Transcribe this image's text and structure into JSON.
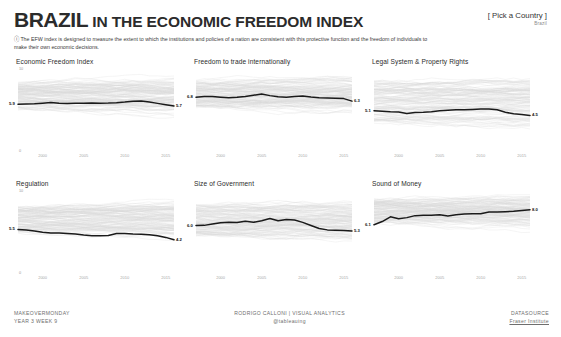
{
  "header": {
    "title_strong": "BRAZIL",
    "title_rest": " IN THE ECONOMIC FREEDOM INDEX",
    "description": "ⓘ The EFW index is designed to measure the extent to which the institutions and policies of a nation are consistent with this protective function and the freedom of individuals to make their own economic decisions.",
    "picker_label": "[ Pick a Country ]",
    "picker_value": "Brazil"
  },
  "axis": {
    "y_top": "10",
    "y_bottom": "0",
    "x_ticks": [
      "2000",
      "2005",
      "2010",
      "2015"
    ]
  },
  "footer": {
    "left_line1": "MAKEOVERMONDAY",
    "left_line2": "YEAR 3 WEEK 9",
    "center_line1": "RODRIGO CALLONI | VISUAL ANALYTICS",
    "center_line2": "@tableauing",
    "right_line1": "DATASOURCE",
    "right_line2": "Fraser Institute"
  },
  "chart_data": [
    {
      "type": "line",
      "title": "Economic Freedom Index",
      "xlabel": "",
      "ylabel": "",
      "ylim": [
        0,
        10
      ],
      "xlim": [
        1997,
        2016
      ],
      "grid": false,
      "legend": "none",
      "start_label": "5.9",
      "end_label": "5.7",
      "x": [
        1997,
        1998,
        1999,
        2000,
        2001,
        2002,
        2003,
        2004,
        2005,
        2006,
        2007,
        2008,
        2009,
        2010,
        2011,
        2012,
        2013,
        2014,
        2015,
        2016
      ],
      "values": [
        5.9,
        5.93,
        5.97,
        6.05,
        6.12,
        6.02,
        6.0,
        6.03,
        6.05,
        6.07,
        6.05,
        6.06,
        6.1,
        6.18,
        6.3,
        6.33,
        6.2,
        6.02,
        5.85,
        5.7
      ],
      "band": {
        "description": "light grey background lines of all other countries",
        "top": 8.6,
        "bottom": 5.3
      }
    },
    {
      "type": "line",
      "title": "Freedom to trade internationally",
      "xlabel": "",
      "ylabel": "",
      "ylim": [
        0,
        10
      ],
      "xlim": [
        1997,
        2016
      ],
      "grid": false,
      "legend": "none",
      "start_label": "6.8",
      "end_label": "6.3",
      "x": [
        1997,
        1998,
        1999,
        2000,
        2001,
        2002,
        2003,
        2004,
        2005,
        2006,
        2007,
        2008,
        2009,
        2010,
        2011,
        2012,
        2013,
        2014,
        2015,
        2016
      ],
      "values": [
        6.8,
        6.88,
        6.9,
        6.8,
        6.72,
        6.78,
        6.9,
        7.05,
        7.2,
        7.0,
        6.85,
        6.78,
        6.88,
        6.95,
        6.82,
        6.72,
        6.7,
        6.68,
        6.62,
        6.3
      ],
      "band": {
        "description": "light grey background lines of all other countries",
        "top": 8.8,
        "bottom": 5.6
      }
    },
    {
      "type": "line",
      "title": "Legal System & Property Rights",
      "xlabel": "",
      "ylabel": "",
      "ylim": [
        0,
        10
      ],
      "xlim": [
        1997,
        2016
      ],
      "grid": false,
      "legend": "none",
      "start_label": "5.1",
      "end_label": "4.5",
      "x": [
        1997,
        1998,
        1999,
        2000,
        2001,
        2002,
        2003,
        2004,
        2005,
        2006,
        2007,
        2008,
        2009,
        2010,
        2011,
        2012,
        2013,
        2014,
        2015,
        2016
      ],
      "values": [
        5.1,
        5.02,
        4.95,
        4.92,
        4.75,
        4.88,
        4.9,
        4.95,
        5.08,
        5.15,
        5.2,
        5.22,
        5.25,
        5.3,
        5.32,
        5.22,
        4.9,
        4.7,
        4.6,
        4.5
      ],
      "band": {
        "description": "light grey background lines of all other countries",
        "top": 8.9,
        "bottom": 3.6
      }
    },
    {
      "type": "line",
      "title": "Regulation",
      "xlabel": "",
      "ylabel": "",
      "ylim": [
        0,
        10
      ],
      "xlim": [
        1997,
        2016
      ],
      "grid": false,
      "legend": "none",
      "start_label": "5.5",
      "end_label": "4.2",
      "x": [
        1997,
        1998,
        1999,
        2000,
        2001,
        2002,
        2003,
        2004,
        2005,
        2006,
        2007,
        2008,
        2009,
        2010,
        2011,
        2012,
        2013,
        2014,
        2015,
        2016
      ],
      "values": [
        5.5,
        5.42,
        5.3,
        5.15,
        5.05,
        5.06,
        5.0,
        4.92,
        4.8,
        4.72,
        4.7,
        4.75,
        5.0,
        4.98,
        4.92,
        4.9,
        4.82,
        4.7,
        4.5,
        4.2
      ],
      "band": {
        "description": "light grey background lines of all other countries",
        "top": 8.3,
        "bottom": 5.2
      }
    },
    {
      "type": "line",
      "title": "Size of Government",
      "xlabel": "",
      "ylabel": "",
      "ylim": [
        0,
        10
      ],
      "xlim": [
        1997,
        2016
      ],
      "grid": false,
      "legend": "none",
      "start_label": "6.0",
      "end_label": "5.3",
      "x": [
        1997,
        1998,
        1999,
        2000,
        2001,
        2002,
        2003,
        2004,
        2005,
        2006,
        2007,
        2008,
        2009,
        2010,
        2011,
        2012,
        2013,
        2014,
        2015,
        2016
      ],
      "values": [
        6.0,
        6.02,
        6.2,
        6.35,
        6.4,
        6.38,
        6.55,
        6.4,
        6.6,
        6.9,
        6.6,
        6.75,
        6.7,
        6.4,
        6.0,
        5.62,
        5.45,
        5.4,
        5.36,
        5.3
      ],
      "band": {
        "description": "light grey background lines of all other countries",
        "top": 8.6,
        "bottom": 4.8
      }
    },
    {
      "type": "line",
      "title": "Sound of Money",
      "xlabel": "",
      "ylabel": "",
      "ylim": [
        0,
        10
      ],
      "xlim": [
        1997,
        2016
      ],
      "grid": false,
      "legend": "none",
      "start_label": "6.1",
      "end_label": "8.0",
      "x": [
        1997,
        1998,
        1999,
        2000,
        2001,
        2002,
        2003,
        2004,
        2005,
        2006,
        2007,
        2008,
        2009,
        2010,
        2011,
        2012,
        2013,
        2014,
        2015,
        2016
      ],
      "values": [
        6.1,
        6.5,
        7.1,
        6.85,
        7.0,
        7.25,
        7.3,
        7.3,
        7.35,
        7.2,
        7.35,
        7.45,
        7.5,
        7.5,
        7.7,
        7.72,
        7.75,
        7.8,
        7.9,
        8.0
      ],
      "band": {
        "description": "light grey background lines of all other countries",
        "top": 9.2,
        "bottom": 6.4
      }
    }
  ]
}
